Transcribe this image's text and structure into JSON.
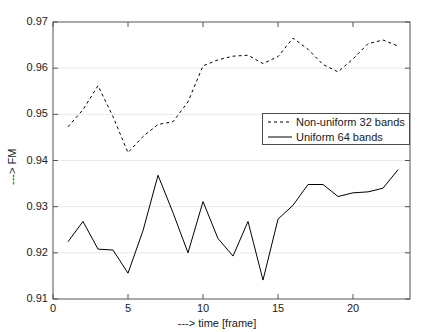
{
  "chart_data": {
    "type": "line",
    "title": "",
    "xlabel": "---> time [frame]",
    "ylabel": "---> FM",
    "xlim": [
      0,
      23.8
    ],
    "ylim": [
      0.91,
      0.97
    ],
    "xticks": [
      0,
      5,
      10,
      15,
      20
    ],
    "xticklabels": [
      "0",
      "5",
      "10",
      "15",
      "20"
    ],
    "yticks": [
      0.91,
      0.92,
      0.93,
      0.94,
      0.95,
      0.96,
      0.97
    ],
    "yticklabels": [
      "0.91",
      "0.92",
      "0.93",
      "0.94",
      "0.95",
      "0.96",
      "0.97"
    ],
    "grid": true,
    "grid_axis": "y",
    "legend_position": "center-right",
    "x": [
      1,
      2,
      3,
      4,
      5,
      6,
      7,
      8,
      9,
      10,
      11,
      12,
      13,
      14,
      15,
      16,
      17,
      18,
      19,
      20,
      21,
      22,
      23
    ],
    "series": [
      {
        "name": "Non-uniform 32 bands",
        "style": "dashed",
        "color": "#000000",
        "values": [
          0.9473,
          0.951,
          0.9562,
          0.9495,
          0.9417,
          0.9452,
          0.9478,
          0.9484,
          0.9527,
          0.9605,
          0.9618,
          0.9626,
          0.9628,
          0.961,
          0.9625,
          0.9665,
          0.9641,
          0.9608,
          0.9592,
          0.962,
          0.9653,
          0.9661,
          0.9648
        ]
      },
      {
        "name": "Uniform 64 bands",
        "style": "solid",
        "color": "#000000",
        "values": [
          0.9224,
          0.9268,
          0.9208,
          0.9206,
          0.9156,
          0.9248,
          0.9368,
          0.9287,
          0.92,
          0.9311,
          0.9231,
          0.9193,
          0.9268,
          0.9141,
          0.9273,
          0.9303,
          0.9348,
          0.9348,
          0.9322,
          0.933,
          0.9332,
          0.934,
          0.938
        ]
      }
    ]
  },
  "legend": {
    "entries": [
      {
        "label": "Non-uniform 32 bands",
        "style": "dashed"
      },
      {
        "label": "Uniform 64 bands",
        "style": "solid"
      }
    ]
  },
  "axes": {
    "xlabel": "---> time [frame]",
    "ylabel": "---> FM"
  }
}
